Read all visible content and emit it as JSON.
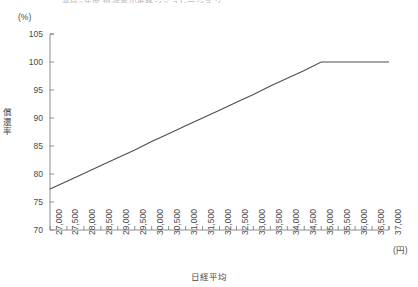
{
  "figure": {
    "cut_title": "平成○年度 償還率の推移シミュレーション",
    "y_unit": "(%)",
    "x_unit": "(円)",
    "y_axis_label": "償還率",
    "x_axis_label": "日経平均"
  },
  "chart_data": {
    "type": "line",
    "title": "",
    "xlabel": "日経平均",
    "ylabel": "償還率",
    "x_unit": "(円)",
    "y_unit": "(%)",
    "xlim": [
      27000,
      37000
    ],
    "ylim": [
      70,
      105
    ],
    "grid": false,
    "legend": null,
    "x_ticks": [
      27000,
      27500,
      28000,
      28500,
      29000,
      29500,
      30000,
      30500,
      31000,
      31500,
      32000,
      32500,
      33000,
      33500,
      34000,
      34500,
      35000,
      35500,
      36000,
      36500,
      37000
    ],
    "x_tick_labels": [
      "27,000",
      "27,500",
      "28,000",
      "28,500",
      "29,000",
      "29,500",
      "30,000",
      "30,500",
      "31,000",
      "31,500",
      "32,000",
      "32,500",
      "33,000",
      "33,500",
      "34,000",
      "34,500",
      "35,000",
      "35,500",
      "36,000",
      "36,500",
      "37,000"
    ],
    "y_ticks": [
      70,
      75,
      80,
      85,
      90,
      95,
      100,
      105
    ],
    "y_tick_labels": [
      "70",
      "75",
      "80",
      "85",
      "90",
      "95",
      "100",
      "105"
    ],
    "series": [
      {
        "name": "償還率",
        "color": "#4d4d4d",
        "x": [
          27000,
          27500,
          28000,
          28500,
          29000,
          29500,
          30000,
          30500,
          31000,
          31500,
          32000,
          32500,
          33000,
          33500,
          34000,
          34500,
          35000,
          35500,
          36000,
          36500,
          37000
        ],
        "values": [
          77.3,
          78.7,
          80.1,
          81.5,
          82.9,
          84.3,
          85.8,
          87.2,
          88.6,
          90.0,
          91.4,
          92.8,
          94.2,
          95.7,
          97.1,
          98.5,
          100.0,
          100.0,
          100.0,
          100.0,
          100.0
        ]
      }
    ],
    "annotations": [
      {
        "text": "35,000円で償還率100%に到達し以降横ばい",
        "x": 35000,
        "y": 100
      }
    ]
  }
}
